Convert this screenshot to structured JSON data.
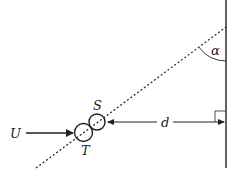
{
  "diagram": {
    "labels": {
      "flow": "U",
      "source": "S",
      "target": "T",
      "distance": "d",
      "angle": "α"
    },
    "elements": {
      "wall": {
        "type": "vertical-line",
        "x": 226,
        "y1": 0,
        "y2": 168
      },
      "trajectory": {
        "type": "dotted-line",
        "from": [
          36,
          168
        ],
        "to": [
          226,
          27
        ]
      },
      "circle_S": {
        "cx": 97,
        "cy": 123,
        "r": 8
      },
      "circle_T": {
        "cx": 83,
        "cy": 133,
        "r": 9
      },
      "flow_arrow": {
        "from": [
          26,
          133
        ],
        "to": [
          73,
          133
        ]
      },
      "distance_arrow": {
        "from": [
          106,
          122
        ],
        "to": [
          225,
          122
        ]
      },
      "angle_arc": {
        "center": [
          226,
          27
        ],
        "radius": 34
      },
      "right_angle_marker": {
        "x": 215,
        "y": 111,
        "size": 11
      }
    },
    "colors": {
      "stroke": "#222222",
      "background": "#ffffff"
    }
  }
}
